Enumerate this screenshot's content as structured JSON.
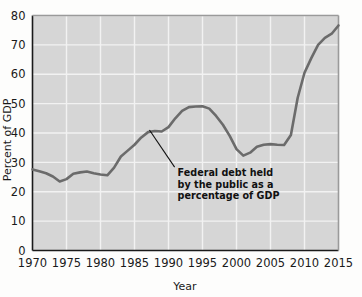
{
  "chart_data": {
    "type": "line",
    "title": "",
    "xlabel": "Year",
    "ylabel": "Percent of GDP",
    "xlim": [
      1970,
      2015
    ],
    "ylim": [
      0,
      80
    ],
    "grid": true,
    "legend": "none",
    "xticks": [
      1970,
      1975,
      1980,
      1985,
      1990,
      1995,
      2000,
      2005,
      2010,
      2015
    ],
    "yticks": [
      0,
      10,
      20,
      30,
      40,
      50,
      60,
      70,
      80
    ],
    "xtick_labels": [
      "1970",
      "1975",
      "1980",
      "1985",
      "1990",
      "1995",
      "2000",
      "2005",
      "2010",
      "2015"
    ],
    "ytick_labels": [
      "0",
      "10",
      "20",
      "30",
      "40",
      "50",
      "60",
      "70",
      "80"
    ],
    "series": [
      {
        "name": "Federal debt held by the public as a percentage of GDP",
        "color": "#6b6b6b",
        "x": [
          1970,
          1971,
          1972,
          1973,
          1974,
          1975,
          1976,
          1977,
          1978,
          1979,
          1980,
          1981,
          1982,
          1983,
          1984,
          1985,
          1986,
          1987,
          1988,
          1989,
          1990,
          1991,
          1992,
          1993,
          1994,
          1995,
          1996,
          1997,
          1998,
          1999,
          2000,
          2001,
          2002,
          2003,
          2004,
          2005,
          2006,
          2007,
          2008,
          2009,
          2010,
          2011,
          2012,
          2013,
          2014,
          2015
        ],
        "values": [
          27.6,
          27.0,
          26.3,
          25.2,
          23.5,
          24.3,
          26.1,
          26.6,
          26.9,
          26.3,
          25.9,
          25.6,
          28.2,
          32.0,
          34.0,
          36.0,
          38.5,
          40.3,
          40.7,
          40.5,
          42.0,
          45.0,
          47.5,
          48.8,
          49.0,
          49.1,
          48.3,
          45.8,
          42.8,
          39.0,
          34.5,
          32.3,
          33.3,
          35.3,
          36.0,
          36.2,
          36.0,
          35.9,
          39.3,
          52.0,
          60.5,
          65.5,
          70.0,
          72.4,
          73.8,
          76.6
        ]
      }
    ],
    "annotations": [
      {
        "text_lines": [
          "Federal debt held",
          "by the public as a",
          "percentage of GDP"
        ],
        "leader_from": {
          "x": 1987.2,
          "y": 41.0
        },
        "leader_to": {
          "x": 1990.9,
          "y": 28.4
        }
      }
    ],
    "style": {
      "plot_background": "#d6d6d6",
      "gridline_color": "#f2f2f2",
      "axis_color": "#1a1a1a",
      "line_color": "#6b6b6b",
      "line_width": 2.6
    }
  }
}
